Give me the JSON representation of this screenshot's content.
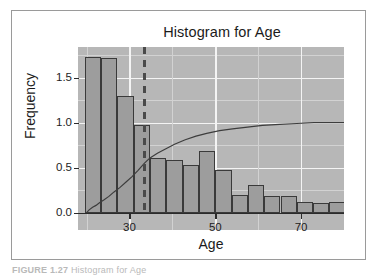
{
  "figure": {
    "caption_number": "FIGURE 1.27",
    "caption_text": "Histogram for Age"
  },
  "colors": {
    "panel_background": "#b7b7b7",
    "bar_fill": "#9d9d9d",
    "bar_outline": "#3a3a3a",
    "major_gridline": "#f4f4f4",
    "minor_gridline": "#d2d2d2",
    "mean_line": "#4a4a4a",
    "cdf_line": "#3d3d3d",
    "axis": "#2b2b2b",
    "text": "#1b1b1b",
    "frame": "#9a9a9a"
  },
  "chart_data": {
    "type": "bar",
    "title": "Histogram for Age",
    "xlabel": "Age",
    "ylabel": "Frequency",
    "xlim": [
      18,
      80
    ],
    "ylim": [
      0.0,
      1.85
    ],
    "grid": true,
    "legend_position": "none",
    "xticks": [
      30,
      50,
      70
    ],
    "xtick_labels": [
      "30",
      "50",
      "70"
    ],
    "yticks": [
      0.0,
      0.5,
      1.0,
      1.5
    ],
    "ytick_labels": [
      "0.0",
      "0.5",
      "1.0",
      "1.5"
    ],
    "x_minor_ticks": [
      20,
      40,
      60,
      80
    ],
    "y_minor_ticks": [
      0.25,
      0.75,
      1.25,
      1.75
    ],
    "bin_width": 3.8,
    "bins": [
      {
        "x_start": 19.6,
        "x_end": 23.4,
        "value": 1.73
      },
      {
        "x_start": 23.4,
        "x_end": 27.2,
        "value": 1.72
      },
      {
        "x_start": 27.2,
        "x_end": 31.0,
        "value": 1.3
      },
      {
        "x_start": 31.0,
        "x_end": 34.8,
        "value": 0.97
      },
      {
        "x_start": 34.8,
        "x_end": 38.6,
        "value": 0.61
      },
      {
        "x_start": 38.6,
        "x_end": 42.4,
        "value": 0.59
      },
      {
        "x_start": 42.4,
        "x_end": 46.2,
        "value": 0.53
      },
      {
        "x_start": 46.2,
        "x_end": 50.0,
        "value": 0.68
      },
      {
        "x_start": 50.0,
        "x_end": 53.8,
        "value": 0.47
      },
      {
        "x_start": 53.8,
        "x_end": 57.6,
        "value": 0.2
      },
      {
        "x_start": 57.6,
        "x_end": 61.4,
        "value": 0.31
      },
      {
        "x_start": 61.4,
        "x_end": 65.2,
        "value": 0.19
      },
      {
        "x_start": 65.2,
        "x_end": 69.0,
        "value": 0.19
      },
      {
        "x_start": 69.0,
        "x_end": 72.8,
        "value": 0.12
      },
      {
        "x_start": 72.8,
        "x_end": 76.6,
        "value": 0.11
      },
      {
        "x_start": 76.6,
        "x_end": 80.4,
        "value": 0.12
      },
      {
        "x_start": 80.4,
        "x_end": 84.2,
        "value": 0.05
      },
      {
        "x_start": 84.2,
        "x_end": 88.0,
        "value": 0.01
      }
    ],
    "annotations": [
      {
        "type": "vline",
        "label": "mean-age",
        "x": 33.5,
        "style": "dashed"
      }
    ],
    "overlays": [
      {
        "name": "empirical-cdf",
        "type": "line",
        "note": "step-like rising curve on left portion",
        "points": [
          [
            20.0,
            0.0
          ],
          [
            20.6,
            0.03
          ],
          [
            21.4,
            0.06
          ],
          [
            22.2,
            0.08
          ],
          [
            23.0,
            0.11
          ],
          [
            24.0,
            0.14
          ],
          [
            25.2,
            0.18
          ],
          [
            26.4,
            0.23
          ],
          [
            27.8,
            0.28
          ],
          [
            29.2,
            0.34
          ],
          [
            30.6,
            0.4
          ],
          [
            32.0,
            0.47
          ],
          [
            33.5,
            0.55
          ],
          [
            34.6,
            0.6
          ]
        ]
      },
      {
        "name": "theoretical-cdf",
        "type": "line",
        "note": "smooth concave curve approaching 1.0",
        "points": [
          [
            34.6,
            0.6
          ],
          [
            36.5,
            0.66
          ],
          [
            38.5,
            0.71
          ],
          [
            40.5,
            0.76
          ],
          [
            43.0,
            0.81
          ],
          [
            45.5,
            0.85
          ],
          [
            48.0,
            0.88
          ],
          [
            51.0,
            0.91
          ],
          [
            54.0,
            0.93
          ],
          [
            57.5,
            0.95
          ],
          [
            61.0,
            0.97
          ],
          [
            65.0,
            0.98
          ],
          [
            69.0,
            0.99
          ],
          [
            73.0,
            1.0
          ],
          [
            78.0,
            1.0
          ],
          [
            88.0,
            1.0
          ]
        ]
      }
    ]
  }
}
